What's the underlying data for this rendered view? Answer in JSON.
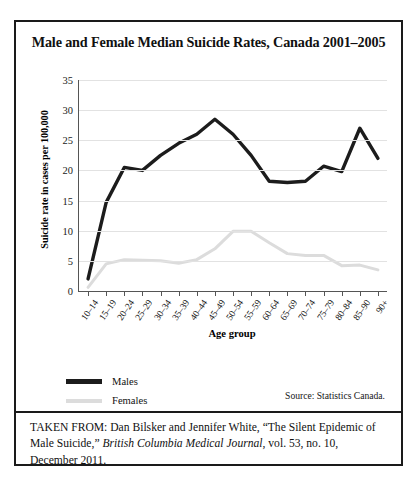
{
  "figure": {
    "title": "Male and Female Median Suicide Rates, Canada 2001–2005",
    "source_note": "Source: Statistics Canada.",
    "caption_prefix": "TAKEN FROM: Dan Bilsker and Jennifer White, “The Silent Epidemic of Male Suicide,” ",
    "caption_italic": "British Columbia Medical Journal",
    "caption_suffix": ", vol. 53, no. 10, December 2011."
  },
  "colors": {
    "males": "#1c1c1c",
    "females": "#dcdcdc",
    "grid": "#e2e2e2",
    "axis": "#555555",
    "frame": "#1a1a1a",
    "background": "#ffffff"
  },
  "legend": {
    "position": "below-axis-left",
    "entries": [
      {
        "label": "Males",
        "color": "#1c1c1c"
      },
      {
        "label": "Females",
        "color": "#dcdcdc"
      }
    ]
  },
  "chart_data": {
    "type": "line",
    "title": "Male and Female Median Suicide Rates, Canada 2001–2005",
    "xlabel": "Age group",
    "ylabel": "Suicide rate in cases per 100,000",
    "ylim": [
      0,
      35
    ],
    "yticks": [
      0,
      5,
      10,
      15,
      20,
      25,
      30,
      35
    ],
    "grid": true,
    "legend_position": "bottom-left",
    "annotations": [
      "Source: Statistics Canada."
    ],
    "categories": [
      "10–14",
      "15–19",
      "20–24",
      "25–29",
      "30–34",
      "35–39",
      "40–44",
      "45–49",
      "50–54",
      "55–59",
      "60–64",
      "65–69",
      "70–74",
      "75–79",
      "80–84",
      "85–90",
      "90+"
    ],
    "series": [
      {
        "name": "Males",
        "color": "#1c1c1c",
        "values": [
          2.0,
          14.7,
          20.5,
          20.0,
          22.5,
          24.5,
          26.0,
          28.5,
          26.0,
          22.5,
          18.2,
          18.0,
          18.2,
          20.7,
          19.8,
          27.0,
          22.0
        ]
      },
      {
        "name": "Females",
        "color": "#dcdcdc",
        "values": [
          0.6,
          4.5,
          5.2,
          5.1,
          5.0,
          4.6,
          5.2,
          7.0,
          9.9,
          9.9,
          8.0,
          6.2,
          5.9,
          5.9,
          4.2,
          4.3,
          3.5
        ]
      }
    ]
  }
}
